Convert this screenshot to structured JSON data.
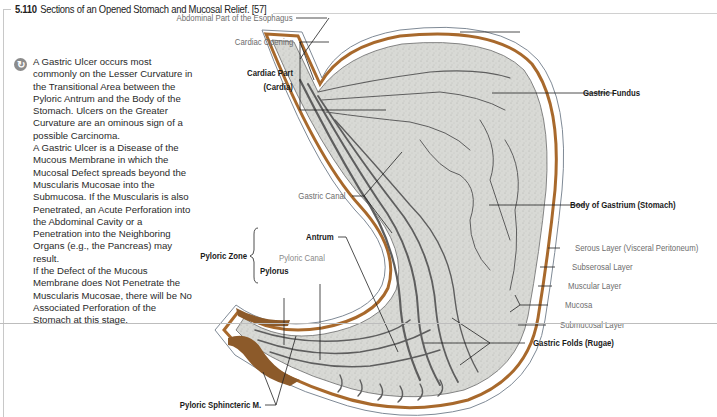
{
  "figure": {
    "number": "5.110",
    "title": "Sections of an Opened Stomach and Mucosal Relief. [57]"
  },
  "note": {
    "icon": "clinical-note-icon",
    "paragraphs": [
      "A Gastric Ulcer occurs most commonly on the Lesser Curvature in the Transitional Area between the Pyloric Antrum and the Body of the Stomach. Ulcers on the Greater Curvature are an ominous sign of a possible Carcinoma.",
      "A Gastric Ulcer is a Disease of the Mucous Membrane in which the Mucosal Defect spreads beyond the Muscularis Mucosae into the Submucosa. If the Muscularis is also Penetrated, an Acute Perforation into the Abdominal Cavity or a Penetration into the Neighboring Organs (e.g., the Pancreas) may result.",
      "If the Defect of the Mucous Membrane does Not Penetrate the Muscularis Mucosae, there will be No Associated Perforation of the Stomach at this stage."
    ]
  },
  "labels": {
    "abdominal_esophagus": "Abdominal Part of the Esophagus",
    "cardiac_opening": "Cardiac Opening",
    "cardiac_part": "Cardiac Part",
    "cardia": "(Cardia)",
    "gastric_canal": "Gastric Canal",
    "pyloric_zone": "Pyloric Zone",
    "antrum": "Antrum",
    "pyloric_canal": "Pyloric Canal",
    "pylorus": "Pylorus",
    "pyloric_sphincter": "Pyloric Sphincteric M.",
    "gastric_fundus": "Gastric Fundus",
    "body_of_gastrium": "Body of Gastrium (Stomach)",
    "serous_layer": "Serous Layer (Visceral Peritoneum)",
    "subserosal_layer": "Subserosal Layer",
    "muscular_layer": "Muscular Layer",
    "mucosa": "Mucosa",
    "submucosal_layer": "Submucosal Layer",
    "gastric_folds": "Gastric Folds (Rugae)"
  },
  "colors": {
    "muscle": "#a8692c",
    "mucosa_fill": "#d9dad6",
    "fold_dark": "#5e5e5e",
    "leader": "#222222",
    "label_gray": "#6d6d6d"
  }
}
